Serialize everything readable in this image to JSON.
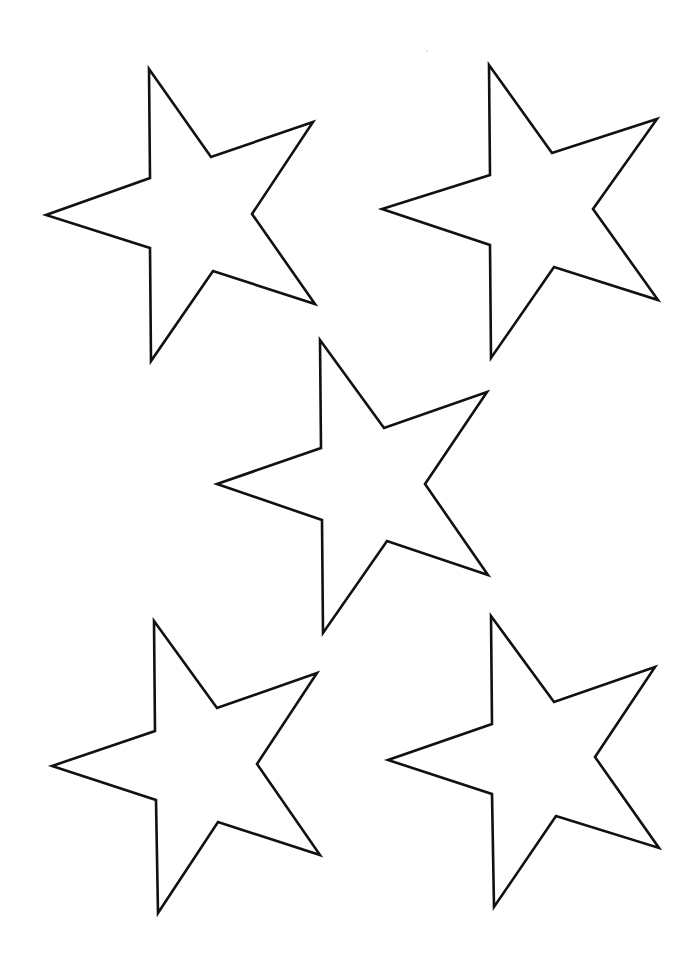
{
  "page": {
    "title": "Five star outlines template",
    "background": "#ffffff",
    "stroke_color": "#111111",
    "width": 676,
    "height": 975
  },
  "stars": [
    {
      "name": "star-top-left",
      "points": "149,69 211,157 313,122 252,214 315,304 213,271 151,361 150,248 46,215 150,178"
    },
    {
      "name": "star-top-right",
      "points": "489,65 552,153 657,119 593,209 658,300 554,267 491,358 490,245 382,209 490,175"
    },
    {
      "name": "star-center",
      "points": "320,340 384,428 487,392 425,484 488,575 387,541 323,633 322,520 217,484 321,448"
    },
    {
      "name": "star-bottom-left",
      "points": "154,621 217,708 317,673 257,764 320,855 218,822 158,913 156,800 52,766 155,731"
    },
    {
      "name": "star-bottom-right",
      "points": "491,616 554,702 655,667 595,757 659,848 556,816 494,907 492,794 388,760 492,724"
    }
  ]
}
